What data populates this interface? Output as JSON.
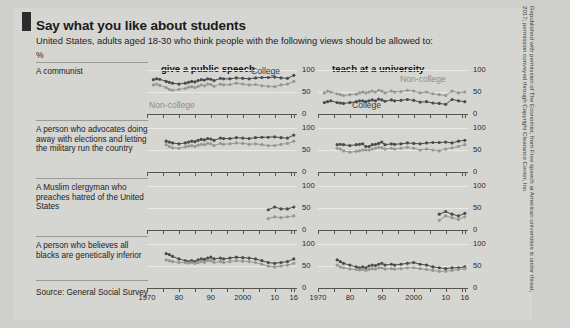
{
  "header": {
    "title": "Say what you like about students",
    "subtitle": "United States, adults aged 18-30 who think people with the following views should be allowed to:",
    "unit": "%",
    "column_headers": [
      "give a public speech",
      "teach at a university"
    ]
  },
  "row_labels": [
    "A communist",
    "A person who advocates doing away with elections and letting the military run the country",
    "A Muslim clergyman who preaches hatred of the United States",
    "A person who believes all blacks are genetically inferior"
  ],
  "source": "Source: General Social Survey",
  "credit": "Republished with permission of The Economist, from Free speech at American universities is under threat, 2017; permission conveyed through Copyright Clearance Center, Inc.",
  "series_labels": {
    "college": "College",
    "noncollege": "Non-college"
  },
  "colors": {
    "college": "#4a4a52",
    "noncollege": "#979792",
    "background": "#d5d5d1",
    "page_background": "#cfcfcb",
    "gridline": "#e9e9e5",
    "axis": "#55554f",
    "mark": "#2b2b2b"
  },
  "chart_data": {
    "type": "line",
    "title": "Say what you like about students",
    "subtitle": "United States, adults aged 18-30 who think people with the following views should be allowed to:",
    "ylabel": "%",
    "xlabel": "",
    "ylim": [
      0,
      100
    ],
    "yticks": [
      0,
      50,
      100
    ],
    "xlim": [
      1970,
      2017
    ],
    "xticks": [
      1970,
      1975,
      1980,
      1985,
      1990,
      1995,
      2000,
      2005,
      2010,
      2016
    ],
    "xticklabels": [
      "1970",
      "",
      "80",
      "",
      "90",
      "",
      "2000",
      "",
      "10",
      "16"
    ],
    "grid": true,
    "legend_position": "inline-annotations",
    "panels": [
      {
        "row": "A communist",
        "column": "give a public speech",
        "college_label_pos": "upper-right",
        "noncollege_label_pos": "lower-left",
        "series": [
          {
            "name": "College",
            "x": [
              1972,
              1973,
              1974,
              1976,
              1977,
              1978,
              1980,
              1982,
              1983,
              1984,
              1985,
              1986,
              1987,
              1988,
              1989,
              1990,
              1991,
              1993,
              1994,
              1996,
              1998,
              2000,
              2002,
              2004,
              2006,
              2008,
              2010,
              2012,
              2014,
              2016
            ],
            "values": [
              78,
              80,
              79,
              74,
              72,
              70,
              68,
              70,
              72,
              74,
              73,
              76,
              78,
              77,
              80,
              79,
              76,
              81,
              80,
              80,
              82,
              81,
              80,
              82,
              83,
              83,
              84,
              82,
              81,
              88
            ]
          },
          {
            "name": "Non-college",
            "x": [
              1972,
              1973,
              1974,
              1976,
              1977,
              1978,
              1980,
              1982,
              1983,
              1984,
              1985,
              1986,
              1987,
              1988,
              1989,
              1990,
              1991,
              1993,
              1994,
              1996,
              1998,
              2000,
              2002,
              2004,
              2006,
              2008,
              2010,
              2012,
              2014,
              2016
            ],
            "values": [
              66,
              68,
              65,
              60,
              56,
              54,
              56,
              58,
              61,
              62,
              60,
              63,
              66,
              64,
              68,
              67,
              63,
              68,
              66,
              67,
              70,
              68,
              66,
              67,
              64,
              63,
              62,
              66,
              68,
              74
            ]
          }
        ]
      },
      {
        "row": "A communist",
        "column": "teach at a university",
        "college_label_pos": "lower-left",
        "noncollege_label_pos": "upper-right",
        "series": [
          {
            "name": "Non-college",
            "x": [
              1972,
              1973,
              1974,
              1976,
              1977,
              1978,
              1980,
              1982,
              1983,
              1984,
              1985,
              1986,
              1987,
              1988,
              1989,
              1990,
              1991,
              1993,
              1994,
              1996,
              1998,
              2000,
              2002,
              2004,
              2006,
              2008,
              2010,
              2012,
              2014,
              2016
            ],
            "values": [
              48,
              52,
              50,
              46,
              44,
              42,
              44,
              45,
              48,
              50,
              48,
              50,
              52,
              50,
              54,
              52,
              48,
              52,
              50,
              51,
              54,
              52,
              48,
              50,
              46,
              44,
              42,
              52,
              48,
              50
            ]
          },
          {
            "name": "College",
            "x": [
              1972,
              1973,
              1974,
              1976,
              1977,
              1978,
              1980,
              1982,
              1983,
              1984,
              1985,
              1986,
              1987,
              1988,
              1989,
              1990,
              1991,
              1993,
              1994,
              1996,
              1998,
              2000,
              2002,
              2004,
              2006,
              2008,
              2010,
              2012,
              2014,
              2016
            ],
            "values": [
              26,
              28,
              30,
              26,
              25,
              24,
              26,
              28,
              30,
              30,
              28,
              30,
              32,
              30,
              34,
              32,
              29,
              32,
              30,
              31,
              33,
              31,
              27,
              28,
              25,
              24,
              22,
              33,
              30,
              28
            ]
          }
        ]
      },
      {
        "row": "A person who advocates doing away with elections and letting the military run the country",
        "column": "give a public speech",
        "college_label_pos": null,
        "noncollege_label_pos": null,
        "series": [
          {
            "name": "College",
            "x": [
              1976,
              1977,
              1978,
              1980,
              1982,
              1983,
              1984,
              1985,
              1986,
              1987,
              1988,
              1989,
              1990,
              1991,
              1993,
              1994,
              1996,
              1998,
              2000,
              2002,
              2004,
              2006,
              2008,
              2010,
              2012,
              2014,
              2016
            ],
            "values": [
              70,
              68,
              66,
              64,
              66,
              68,
              70,
              69,
              72,
              74,
              73,
              76,
              75,
              72,
              77,
              76,
              76,
              78,
              77,
              76,
              78,
              79,
              79,
              80,
              78,
              77,
              84
            ]
          },
          {
            "name": "Non-college",
            "x": [
              1976,
              1977,
              1978,
              1980,
              1982,
              1983,
              1984,
              1985,
              1986,
              1987,
              1988,
              1989,
              1990,
              1991,
              1993,
              1994,
              1996,
              1998,
              2000,
              2002,
              2004,
              2006,
              2008,
              2010,
              2012,
              2014,
              2016
            ],
            "values": [
              62,
              58,
              55,
              54,
              57,
              59,
              60,
              58,
              61,
              63,
              62,
              65,
              64,
              60,
              65,
              63,
              64,
              66,
              65,
              63,
              64,
              62,
              60,
              60,
              63,
              65,
              70
            ]
          }
        ]
      },
      {
        "row": "A person who advocates doing away with elections and letting the military run the country",
        "column": "teach at a university",
        "college_label_pos": null,
        "noncollege_label_pos": null,
        "series": [
          {
            "name": "College",
            "x": [
              1976,
              1977,
              1978,
              1980,
              1982,
              1983,
              1984,
              1985,
              1986,
              1987,
              1988,
              1989,
              1990,
              1991,
              1993,
              1994,
              1996,
              1998,
              2000,
              2002,
              2004,
              2006,
              2008,
              2010,
              2012,
              2014,
              2016
            ],
            "values": [
              62,
              63,
              62,
              60,
              62,
              63,
              64,
              58,
              58,
              62,
              63,
              65,
              68,
              62,
              64,
              63,
              64,
              66,
              65,
              64,
              66,
              67,
              67,
              68,
              66,
              70,
              72
            ]
          },
          {
            "name": "Non-college",
            "x": [
              1976,
              1977,
              1978,
              1980,
              1982,
              1983,
              1984,
              1985,
              1986,
              1987,
              1988,
              1989,
              1990,
              1991,
              1993,
              1994,
              1996,
              1998,
              2000,
              2002,
              2004,
              2006,
              2008,
              2010,
              2012,
              2014,
              2016
            ],
            "values": [
              54,
              52,
              48,
              45,
              47,
              48,
              50,
              50,
              50,
              52,
              54,
              56,
              55,
              52,
              54,
              52,
              54,
              56,
              54,
              50,
              52,
              50,
              48,
              52,
              55,
              58,
              62
            ]
          }
        ]
      },
      {
        "row": "A Muslim clergyman who preaches hatred of the United States",
        "column": "give a public speech",
        "college_label_pos": null,
        "noncollege_label_pos": null,
        "series": [
          {
            "name": "College",
            "x": [
              2008,
              2010,
              2012,
              2014,
              2016
            ],
            "values": [
              46,
              52,
              48,
              48,
              52
            ]
          },
          {
            "name": "Non-college",
            "x": [
              2008,
              2010,
              2012,
              2014,
              2016
            ],
            "values": [
              26,
              30,
              28,
              30,
              32
            ]
          }
        ]
      },
      {
        "row": "A Muslim clergyman who preaches hatred of the United States",
        "column": "teach at a university",
        "college_label_pos": null,
        "noncollege_label_pos": null,
        "series": [
          {
            "name": "College",
            "x": [
              2008,
              2010,
              2012,
              2014,
              2016
            ],
            "values": [
              36,
              42,
              36,
              32,
              38
            ]
          },
          {
            "name": "Non-college",
            "x": [
              2008,
              2010,
              2012,
              2014,
              2016
            ],
            "values": [
              22,
              32,
              28,
              24,
              30
            ]
          }
        ]
      },
      {
        "row": "A person who believes all blacks are genetically inferior",
        "column": "give a public speech",
        "college_label_pos": null,
        "noncollege_label_pos": null,
        "series": [
          {
            "name": "College",
            "x": [
              1976,
              1977,
              1978,
              1980,
              1982,
              1983,
              1984,
              1985,
              1986,
              1987,
              1988,
              1989,
              1990,
              1991,
              1993,
              1994,
              1996,
              1998,
              2000,
              2002,
              2004,
              2006,
              2008,
              2010,
              2012,
              2014,
              2016
            ],
            "values": [
              78,
              76,
              72,
              66,
              62,
              60,
              62,
              60,
              64,
              66,
              65,
              68,
              70,
              66,
              68,
              66,
              68,
              70,
              69,
              68,
              66,
              62,
              58,
              56,
              58,
              60,
              66
            ]
          },
          {
            "name": "Non-college",
            "x": [
              1976,
              1977,
              1978,
              1980,
              1982,
              1983,
              1984,
              1985,
              1986,
              1987,
              1988,
              1989,
              1990,
              1991,
              1993,
              1994,
              1996,
              1998,
              2000,
              2002,
              2004,
              2006,
              2008,
              2010,
              2012,
              2014,
              2016
            ],
            "values": [
              64,
              62,
              60,
              58,
              58,
              57,
              58,
              56,
              58,
              60,
              58,
              62,
              62,
              58,
              60,
              58,
              60,
              62,
              61,
              60,
              58,
              54,
              50,
              48,
              50,
              52,
              56
            ]
          }
        ]
      },
      {
        "row": "A person who believes all blacks are genetically inferior",
        "column": "teach at a university",
        "college_label_pos": null,
        "noncollege_label_pos": null,
        "series": [
          {
            "name": "College",
            "x": [
              1976,
              1977,
              1978,
              1980,
              1982,
              1983,
              1984,
              1985,
              1986,
              1987,
              1988,
              1989,
              1990,
              1991,
              1993,
              1994,
              1996,
              1998,
              2000,
              2002,
              2004,
              2006,
              2008,
              2010,
              2012,
              2014,
              2016
            ],
            "values": [
              64,
              60,
              56,
              52,
              48,
              46,
              48,
              46,
              50,
              52,
              51,
              54,
              56,
              52,
              54,
              52,
              54,
              56,
              58,
              54,
              52,
              48,
              46,
              44,
              46,
              46,
              48
            ]
          },
          {
            "name": "Non-college",
            "x": [
              1976,
              1977,
              1978,
              1980,
              1982,
              1983,
              1984,
              1985,
              1986,
              1987,
              1988,
              1989,
              1990,
              1991,
              1993,
              1994,
              1996,
              1998,
              2000,
              2002,
              2004,
              2006,
              2008,
              2010,
              2012,
              2014,
              2016
            ],
            "values": [
              52,
              48,
              46,
              43,
              42,
              41,
              42,
              40,
              42,
              44,
              43,
              46,
              46,
              43,
              44,
              43,
              44,
              46,
              46,
              44,
              42,
              40,
              38,
              38,
              40,
              42,
              44
            ]
          }
        ]
      }
    ]
  }
}
